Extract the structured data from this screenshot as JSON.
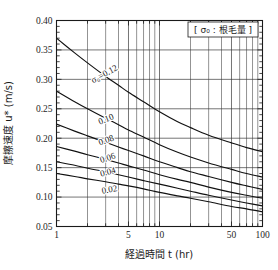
{
  "chart_data": {
    "type": "line",
    "title": "",
    "xlabel": "経過時間  t  (hr)",
    "ylabel": "摩擦速度  u*  (m/s)",
    "xscale": "log",
    "xlim": [
      1,
      100
    ],
    "ylim": [
      0.05,
      0.4
    ],
    "grid": true,
    "xticks": [
      1,
      5,
      10,
      50,
      100
    ],
    "xtick_labels": [
      "1",
      "5",
      "10",
      "50",
      "100"
    ],
    "yticks": [
      0.05,
      0.1,
      0.15,
      0.2,
      0.25,
      0.3,
      0.35,
      0.4
    ],
    "ytick_labels": [
      "0.05",
      "0.10",
      "0.15",
      "0.20",
      "0.25",
      "0.30",
      "0.35",
      "0.40"
    ],
    "yminor_step": 0.01,
    "legend_note": "[ σ₀ : 根毛量 ]",
    "legend_position": "top-right",
    "annotations": [
      {
        "text": "σ₀=0.12",
        "x": 3.0,
        "y": 0.305,
        "rotate": -28
      },
      {
        "text": "0.10",
        "x": 3.1,
        "y": 0.228,
        "rotate": -22
      },
      {
        "text": "0.08",
        "x": 3.1,
        "y": 0.192,
        "rotate": -20
      },
      {
        "text": "0.06",
        "x": 3.2,
        "y": 0.162,
        "rotate": -18
      },
      {
        "text": "0.04",
        "x": 3.2,
        "y": 0.138,
        "rotate": -15
      },
      {
        "text": "0.02",
        "x": 3.3,
        "y": 0.108,
        "rotate": -10
      }
    ],
    "series": [
      {
        "name": "σ₀=0.12",
        "label": "0.12",
        "x": [
          1,
          1.5,
          2,
          3,
          4,
          5,
          7,
          10,
          15,
          20,
          30,
          50,
          70,
          100
        ],
        "y": [
          0.37,
          0.345,
          0.328,
          0.305,
          0.29,
          0.278,
          0.262,
          0.245,
          0.228,
          0.218,
          0.205,
          0.192,
          0.184,
          0.177
        ]
      },
      {
        "name": "σ₀=0.10",
        "label": "0.10",
        "x": [
          1,
          1.5,
          2,
          3,
          4,
          5,
          7,
          10,
          15,
          20,
          30,
          50,
          70,
          100
        ],
        "y": [
          0.28,
          0.262,
          0.25,
          0.234,
          0.223,
          0.214,
          0.202,
          0.189,
          0.176,
          0.168,
          0.158,
          0.147,
          0.14,
          0.134
        ]
      },
      {
        "name": "σ₀=0.08",
        "label": "0.08",
        "x": [
          1,
          1.5,
          2,
          3,
          4,
          5,
          7,
          10,
          15,
          20,
          30,
          50,
          70,
          100
        ],
        "y": [
          0.224,
          0.212,
          0.204,
          0.193,
          0.185,
          0.179,
          0.17,
          0.16,
          0.15,
          0.143,
          0.135,
          0.125,
          0.119,
          0.113
        ]
      },
      {
        "name": "σ₀=0.06",
        "label": "0.06",
        "x": [
          1,
          1.5,
          2,
          3,
          4,
          5,
          7,
          10,
          15,
          20,
          30,
          50,
          70,
          100
        ],
        "y": [
          0.186,
          0.178,
          0.172,
          0.164,
          0.158,
          0.153,
          0.146,
          0.138,
          0.13,
          0.125,
          0.117,
          0.108,
          0.103,
          0.098
        ]
      },
      {
        "name": "σ₀=0.04",
        "label": "0.04",
        "x": [
          1,
          1.5,
          2,
          3,
          4,
          5,
          7,
          10,
          15,
          20,
          30,
          50,
          70,
          100
        ],
        "y": [
          0.16,
          0.154,
          0.149,
          0.143,
          0.138,
          0.134,
          0.128,
          0.122,
          0.115,
          0.11,
          0.103,
          0.095,
          0.09,
          0.085
        ]
      },
      {
        "name": "σ₀=0.02",
        "label": "0.02",
        "x": [
          1,
          1.5,
          2,
          3,
          4,
          5,
          7,
          10,
          15,
          20,
          30,
          50,
          70,
          100
        ],
        "y": [
          0.14,
          0.135,
          0.131,
          0.126,
          0.122,
          0.119,
          0.114,
          0.108,
          0.102,
          0.098,
          0.092,
          0.084,
          0.08,
          0.075
        ]
      }
    ],
    "colors": {
      "curve": "#111111",
      "grid": "#3a3a3a",
      "frame": "#1a1a1a",
      "background": "#ffffff"
    }
  }
}
